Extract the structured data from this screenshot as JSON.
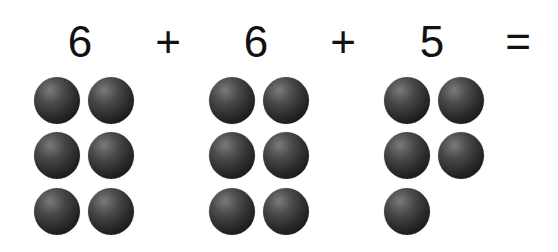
{
  "equation": {
    "terms": [
      {
        "label": "6",
        "x": 80
      },
      {
        "label": "+",
        "x": 168
      },
      {
        "label": "6",
        "x": 256
      },
      {
        "label": "+",
        "x": 343
      },
      {
        "label": "5",
        "x": 432
      },
      {
        "label": "=",
        "x": 518
      }
    ]
  },
  "groups": [
    {
      "count": 6,
      "balls": [
        [
          57,
          100
        ],
        [
          111,
          100
        ],
        [
          57,
          155
        ],
        [
          111,
          155
        ],
        [
          57,
          211
        ],
        [
          111,
          211
        ]
      ]
    },
    {
      "count": 6,
      "balls": [
        [
          232,
          100
        ],
        [
          286,
          100
        ],
        [
          232,
          155
        ],
        [
          286,
          155
        ],
        [
          232,
          211
        ],
        [
          286,
          211
        ]
      ]
    },
    {
      "count": 5,
      "balls": [
        [
          407,
          100
        ],
        [
          461,
          100
        ],
        [
          407,
          155
        ],
        [
          461,
          155
        ],
        [
          407,
          211
        ]
      ]
    }
  ],
  "colors": {
    "text": "#111111",
    "background": "#ffffff",
    "ball": "#1e1e1e"
  }
}
